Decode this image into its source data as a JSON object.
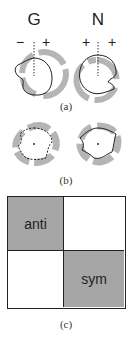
{
  "panel_a": {
    "caption": "(a)",
    "left": {
      "title": "G",
      "sign_left": "−",
      "sign_right": "+"
    },
    "right": {
      "title": "N",
      "sign_left": "+",
      "sign_right": "+"
    }
  },
  "panel_b": {
    "caption": "(b)"
  },
  "panel_c": {
    "caption": "(c)",
    "cells": [
      {
        "label": "anti",
        "fill": "#a6a6a6"
      },
      {
        "label": "",
        "fill": "#ffffff"
      },
      {
        "label": "",
        "fill": "#ffffff"
      },
      {
        "label": "sym",
        "fill": "#a6a6a6"
      }
    ]
  },
  "colors": {
    "shade": "#b0b0b0",
    "stroke": "#222222"
  }
}
